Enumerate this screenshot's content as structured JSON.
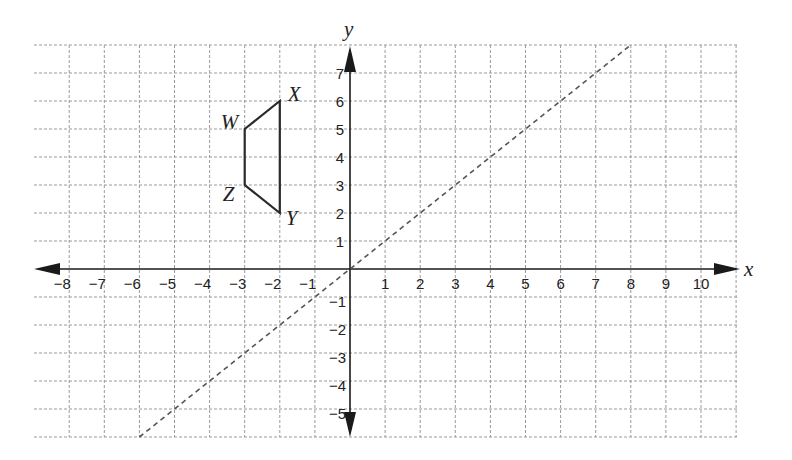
{
  "diagram": {
    "axes": {
      "x_label": "x",
      "y_label": "y",
      "x_ticks": [
        "−8",
        "−7",
        "−6",
        "−5",
        "−4",
        "−3",
        "−2",
        "−1",
        "1",
        "2",
        "3",
        "4",
        "5",
        "6",
        "7",
        "8",
        "9",
        "10"
      ],
      "y_ticks_pos": [
        "1",
        "2",
        "3",
        "4",
        "5",
        "6",
        "7"
      ],
      "y_ticks_neg": [
        "−1",
        "−2",
        "−3",
        "−4",
        "−5"
      ],
      "x_range": [
        -8,
        10
      ],
      "y_range": [
        -5,
        7
      ]
    },
    "shape": {
      "name": "WXYZ",
      "vertices": [
        {
          "label": "W",
          "x": -3,
          "y": 5
        },
        {
          "label": "X",
          "x": -2,
          "y": 6
        },
        {
          "label": "Y",
          "x": -2,
          "y": 2
        },
        {
          "label": "Z",
          "x": -3,
          "y": 3
        }
      ]
    },
    "line": {
      "equation": "y = x",
      "style": "dashed",
      "from": [
        -6,
        -6
      ],
      "to": [
        8,
        8
      ]
    },
    "colors": {
      "grid": "#9a9a9a",
      "axis": "#1a1a1a",
      "shape": "#2a2a2a",
      "dashed": "#555555"
    }
  }
}
